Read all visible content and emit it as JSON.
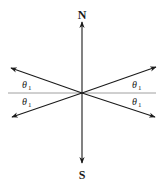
{
  "diagram": {
    "labels": {
      "north": "N",
      "south": "S",
      "theta_symbol": "θ",
      "theta_subscript": "1"
    },
    "angle_labels": [
      {
        "position": "upper-left",
        "text": "θ",
        "sub": "1"
      },
      {
        "position": "lower-left",
        "text": "θ",
        "sub": "1"
      },
      {
        "position": "upper-right",
        "text": "θ",
        "sub": "1"
      },
      {
        "position": "lower-right",
        "text": "θ",
        "sub": "1"
      }
    ],
    "colors": {
      "arrow": "#1a1a1a",
      "reference_line": "#777777",
      "background": "#ffffff"
    }
  }
}
